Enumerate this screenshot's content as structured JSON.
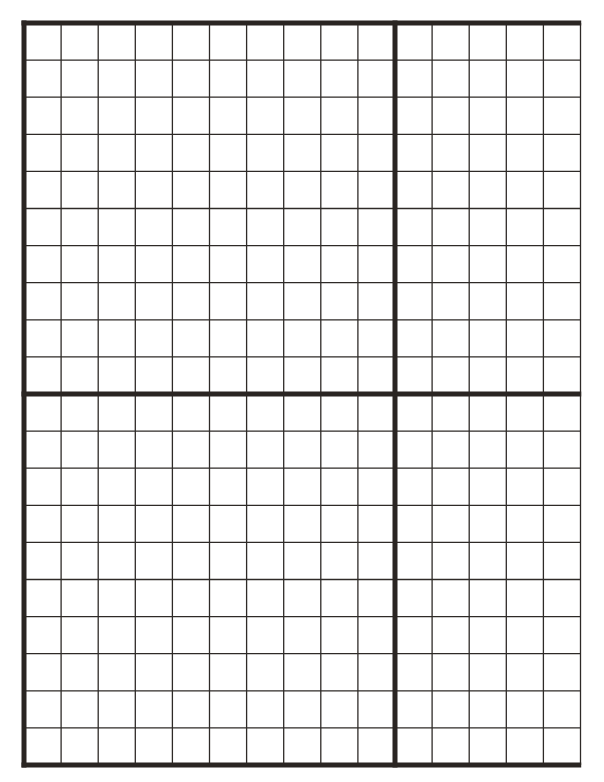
{
  "page": {
    "type": "graph-paper",
    "background": "#ffffff",
    "line_color": "#2e2a27",
    "thick_line_color": "#2a2522"
  },
  "grid": {
    "left": 24,
    "top": 23,
    "cell_size": 37.1,
    "columns": 15,
    "rows": 20,
    "thin_line_width": 1.3,
    "thick_line_width": 5,
    "thick_columns": [
      0,
      10
    ],
    "thick_rows": [
      0,
      10,
      20
    ],
    "thin_right_edge": true
  }
}
